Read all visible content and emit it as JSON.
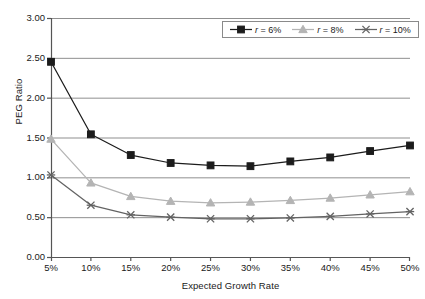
{
  "chart_data": {
    "type": "line",
    "title": "",
    "xlabel": "Expected Growth Rate",
    "ylabel": "PEG Ratio",
    "categories": [
      "5%",
      "10%",
      "15%",
      "20%",
      "25%",
      "30%",
      "35%",
      "40%",
      "45%",
      "50%"
    ],
    "x_tick_labels": [
      "5%",
      "10%",
      "15%",
      "20%",
      "25%",
      "30%",
      "35%",
      "40%",
      "45%",
      "50%"
    ],
    "y_tick_labels": [
      "0.00",
      "0.50",
      "1.00",
      "1.50",
      "2.00",
      "2.50",
      "3.00"
    ],
    "ylim": [
      0.0,
      3.0
    ],
    "y_tick_step": 0.5,
    "grid": "horizontal",
    "legend_position": "top-right",
    "series": [
      {
        "name": "r = 6%",
        "label_prefix": "r",
        "label_value": "= 6%",
        "marker": "square",
        "color": "#1c1c1c",
        "values": [
          2.45,
          1.54,
          1.28,
          1.18,
          1.15,
          1.14,
          1.2,
          1.25,
          1.33,
          1.4
        ]
      },
      {
        "name": "r = 8%",
        "label_prefix": "r",
        "label_value": "= 8%",
        "marker": "triangle",
        "color": "#b4b4b4",
        "values": [
          1.48,
          0.93,
          0.76,
          0.7,
          0.68,
          0.69,
          0.71,
          0.74,
          0.78,
          0.82
        ]
      },
      {
        "name": "r = 10%",
        "label_prefix": "r",
        "label_value": "= 10%",
        "marker": "cross",
        "color": "#636363",
        "values": [
          1.03,
          0.65,
          0.53,
          0.5,
          0.48,
          0.48,
          0.49,
          0.51,
          0.54,
          0.57
        ]
      }
    ],
    "axis_color": "#555555",
    "grid_color": "#8f8f8f",
    "background": "#ffffff"
  }
}
